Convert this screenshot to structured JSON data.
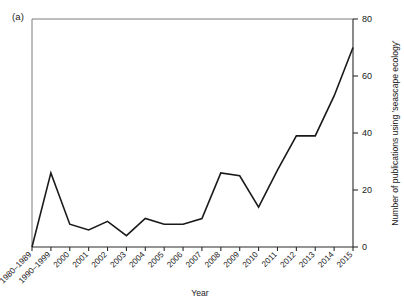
{
  "panel": {
    "label": "(a)"
  },
  "chart_data": {
    "type": "line",
    "title": "",
    "xlabel": "Year",
    "ylabel": "Number of publications using 'seascape ecology'",
    "categories": [
      "1980–1989",
      "1990–1999",
      "2000",
      "2001",
      "2002",
      "2003",
      "2004",
      "2005",
      "2006",
      "2007",
      "2008",
      "2009",
      "2010",
      "2011",
      "2012",
      "2013",
      "2014",
      "2015"
    ],
    "values": [
      0,
      26,
      8,
      6,
      9,
      4,
      10,
      8,
      8,
      10,
      26,
      25,
      14,
      27,
      39,
      39,
      53,
      70
    ],
    "ylim": [
      0,
      80
    ],
    "yticks": [
      0,
      20,
      40,
      60,
      80
    ],
    "ytick_labels": [
      "0",
      "20",
      "40",
      "60",
      "80"
    ],
    "y_axis_position": "right",
    "x_tick_label_rotation": -45,
    "grid": false,
    "legend": null,
    "line_color": "#1a1a1a",
    "line_width": 1.6
  }
}
